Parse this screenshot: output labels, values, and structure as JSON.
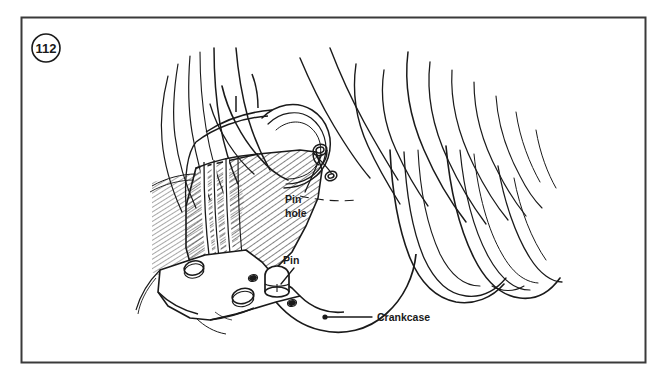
{
  "figure": {
    "number": "112",
    "frame": {
      "x": 21,
      "y": 17,
      "width": 624,
      "height": 345,
      "border_color": "#3a3a3a",
      "background": "#ffffff"
    },
    "badge": {
      "name": "figure-number-badge",
      "cx": 46,
      "cy": 48,
      "r": 14
    },
    "line_color": "#1a1a1a",
    "hatch_color": "#1a1a1a"
  },
  "callouts": [
    {
      "id": "pin-hole",
      "lines": [
        "Pin",
        "hole"
      ],
      "text_x": 285,
      "text_y": 203,
      "line_height": 14,
      "leader": {
        "from_x": 305,
        "from_y": 192,
        "to_x": 322,
        "to_y": 152,
        "style": "plain"
      }
    },
    {
      "id": "pin",
      "lines": [
        "Pin"
      ],
      "text_x": 283,
      "text_y": 264,
      "line_height": 14,
      "leader": {
        "from_x": 294,
        "from_y": 268,
        "to_x": 280,
        "to_y": 286,
        "style": "plain"
      }
    },
    {
      "id": "crankcase",
      "lines": [
        "Crankcase"
      ],
      "text_x": 377,
      "text_y": 321,
      "line_height": 14,
      "leader": {
        "from_x": 372,
        "from_y": 317,
        "to_x": 325,
        "to_y": 317,
        "style": "dot-terminated",
        "dot_x": 325,
        "dot_y": 317,
        "dot_r": 2.6
      }
    }
  ],
  "drawing_parts": [
    {
      "name": "cylinder-fins",
      "description": "engine cylinder cooling fins sweeping from upper left to lower right"
    },
    {
      "name": "cylinder-barrel-section",
      "description": "cross-hatched sectioned cylinder skirt"
    },
    {
      "name": "crankcase-flange",
      "description": "crankcase mating flange with bolt holes"
    },
    {
      "name": "dowel-pin",
      "description": "cylindrical dowel pin standing on the crankcase flange"
    },
    {
      "name": "pin-hole-detail",
      "description": "hole in cylinder skirt that receives the dowel pin"
    }
  ]
}
